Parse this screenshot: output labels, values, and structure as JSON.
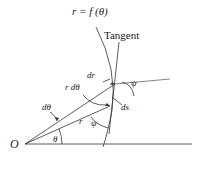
{
  "diagram": {
    "curve_label": "r = f (θ)",
    "tangent_label": "Tangent",
    "origin_label": "O",
    "labels": {
      "theta": "θ",
      "d_theta": "dθ",
      "r": "r",
      "r_d_theta": "r dθ",
      "dr": "dr",
      "ds": "ds",
      "psi_lower": "ψ",
      "psi_upper": "ψ"
    },
    "colors": {
      "stroke": "#333333",
      "text": "#1a1a1a"
    }
  }
}
